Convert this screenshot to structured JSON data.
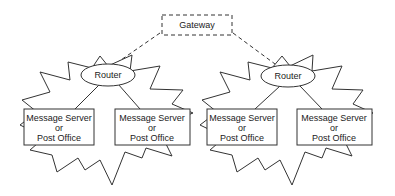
{
  "diagram": {
    "gateway": {
      "label": "Gateway"
    },
    "networks": [
      {
        "router": {
          "label": "Router"
        },
        "servers": [
          {
            "line1": "Message Server",
            "line2": "or",
            "line3": "Post Office"
          },
          {
            "line1": "Message Server",
            "line2": "or",
            "line3": "Post Office"
          }
        ]
      },
      {
        "router": {
          "label": "Router"
        },
        "servers": [
          {
            "line1": "Message Server",
            "line2": "or",
            "line3": "Post Office"
          },
          {
            "line1": "Message Server",
            "line2": "or",
            "line3": "Post Office"
          }
        ]
      }
    ],
    "colors": {
      "stroke": "#333333",
      "background": "#ffffff"
    }
  }
}
